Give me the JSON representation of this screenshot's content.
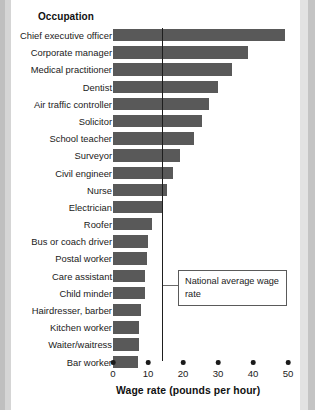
{
  "chart_data": {
    "type": "bar",
    "orientation": "horizontal",
    "title": "Occupation",
    "xlabel": "Wage rate (pounds per hour)",
    "ylabel": "Occupation",
    "xlim": [
      0,
      50
    ],
    "xticks": [
      0,
      10,
      20,
      30,
      40,
      50
    ],
    "xtick_labels": [
      "0",
      "10",
      "20",
      "30",
      "40",
      "50"
    ],
    "grid": false,
    "legend": false,
    "bar_color": "#595959",
    "categories": [
      "Chief executive officer",
      "Corporate manager",
      "Medical practitioner",
      "Dentist",
      "Air traffic controller",
      "Solicitor",
      "School teacher",
      "Surveyor",
      "Civil engineer",
      "Nurse",
      "Electrician",
      "Roofer",
      "Bus or coach driver",
      "Postal worker",
      "Care assistant",
      "Child minder",
      "Hairdresser, barber",
      "Kitchen worker",
      "Waiter/waitress",
      "Bar worker"
    ],
    "values": [
      49,
      38.5,
      34,
      30,
      27.5,
      25.5,
      23,
      19,
      17,
      15.5,
      14,
      11,
      10,
      9.7,
      9,
      9,
      8,
      7.5,
      7.5,
      7
    ],
    "annotations": [
      {
        "name": "national-average-wage-rate",
        "text": "National average wage rate",
        "value": 14,
        "type": "vertical-reference-line"
      }
    ]
  },
  "axis": {
    "title": "Wage rate (pounds per hour)"
  },
  "annotation": {
    "label": "National average wage rate"
  }
}
